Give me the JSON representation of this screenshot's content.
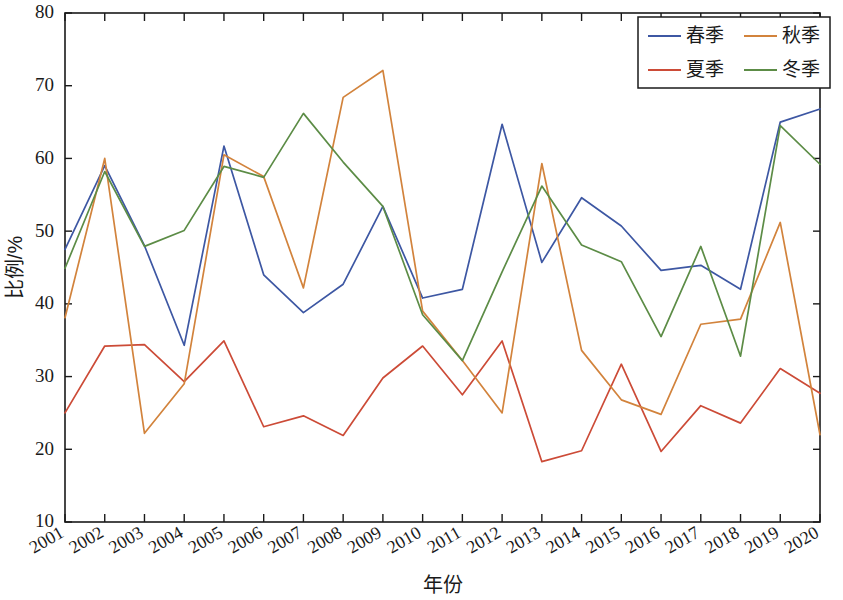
{
  "chart_data": {
    "type": "line",
    "title": "",
    "xlabel": "年份",
    "ylabel": "比例/%",
    "grid": false,
    "legend_position": "top-right",
    "xlim": [
      2001,
      2020
    ],
    "ylim": [
      10,
      80
    ],
    "ytick_step": 10,
    "yticks": [
      10,
      20,
      30,
      40,
      50,
      60,
      70,
      80
    ],
    "categories": [
      "2001",
      "2002",
      "2003",
      "2004",
      "2005",
      "2006",
      "2007",
      "2008",
      "2009",
      "2010",
      "2011",
      "2012",
      "2013",
      "2014",
      "2015",
      "2016",
      "2017",
      "2018",
      "2019",
      "2020"
    ],
    "series": [
      {
        "name": "春季",
        "color": "#3d57a3",
        "values": [
          47.5,
          59.0,
          48.0,
          34.3,
          61.7,
          44.0,
          38.8,
          42.7,
          53.4,
          40.8,
          42.0,
          64.7,
          45.7,
          54.6,
          50.7,
          44.6,
          45.3,
          42.0,
          65.0,
          66.8
        ]
      },
      {
        "name": "夏季",
        "color": "#cc4b37",
        "values": [
          25.0,
          34.2,
          34.4,
          29.3,
          34.9,
          23.1,
          24.6,
          21.9,
          29.8,
          34.2,
          27.5,
          34.9,
          18.3,
          19.8,
          31.7,
          19.7,
          26.0,
          23.6,
          31.1,
          27.7
        ]
      },
      {
        "name": "秋季",
        "color": "#d2833c",
        "values": [
          38.1,
          60.0,
          22.2,
          29.0,
          60.5,
          57.5,
          42.2,
          68.4,
          72.1,
          39.0,
          32.2,
          25.0,
          59.3,
          33.6,
          26.8,
          24.8,
          37.2,
          37.9,
          51.2,
          22.0
        ]
      },
      {
        "name": "冬季",
        "color": "#5c8c46",
        "values": [
          44.9,
          58.2,
          47.9,
          50.1,
          58.9,
          57.4,
          66.2,
          59.5,
          53.4,
          38.5,
          32.2,
          44.4,
          56.2,
          48.1,
          45.8,
          35.5,
          47.9,
          32.8,
          64.5,
          59.2
        ]
      }
    ]
  },
  "legend": {
    "entries": [
      {
        "label": "春季",
        "color": "#3d57a3"
      },
      {
        "label": "秋季",
        "color": "#d2833c"
      },
      {
        "label": "夏季",
        "color": "#cc4b37"
      },
      {
        "label": "冬季",
        "color": "#5c8c46"
      }
    ]
  },
  "axes": {
    "y_title": "比例/%",
    "x_title": "年份"
  }
}
